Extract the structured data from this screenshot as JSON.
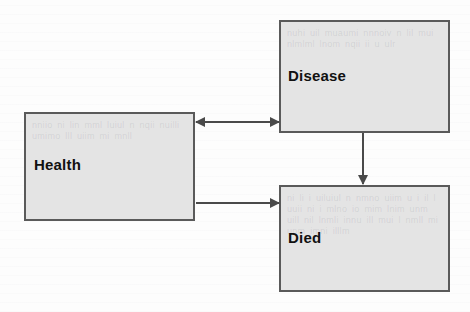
{
  "diagram": {
    "type": "flow-diagram",
    "background_color": "#fdfdfd",
    "node_fill_color": "#e4e4e4",
    "node_border_color": "#5a5a5a",
    "edge_color": "#4a4a4a",
    "label_color": "#111111",
    "nodes": [
      {
        "id": "health",
        "label": "Health",
        "x": 24,
        "y": 112,
        "width": 171,
        "height": 109
      },
      {
        "id": "disease",
        "label": "Disease",
        "x": 279,
        "y": 20,
        "width": 171,
        "height": 113
      },
      {
        "id": "died",
        "label": "Died",
        "x": 279,
        "y": 185,
        "width": 171,
        "height": 107
      }
    ],
    "edges": [
      {
        "id": "health-disease",
        "from": "health",
        "to": "disease",
        "direction": "bidirectional",
        "label": ""
      },
      {
        "id": "health-died",
        "from": "health",
        "to": "died",
        "direction": "forward",
        "label": ""
      },
      {
        "id": "disease-died",
        "from": "disease",
        "to": "died",
        "direction": "forward",
        "label": ""
      }
    ],
    "ghost_text": {
      "disease": "nuhi uil muaumi nnnoiv n lil mui nlmlml lnom nqii ii u ulr",
      "health": "nniio ni lin mml luiul n nqii nuilli umimo lll uiim mi mnll",
      "died": "ni li i uiluiul n nmno uiim u i il l uuii ni i mlno io mim lnim unm uill nil lnmli innu ill mui l nmll mi unm imni illlm"
    }
  }
}
